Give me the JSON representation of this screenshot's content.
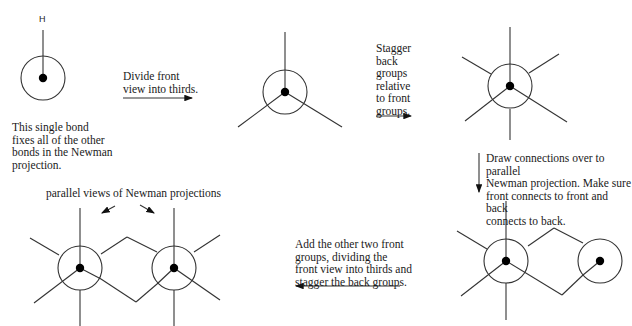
{
  "diagram": {
    "type": "newman-projection-construction-steps",
    "steps": [
      {
        "id": "step1",
        "substituent_label": "H",
        "caption": "This single bond\nfixes all of the other\nbonds in the Newman\nprojection."
      },
      {
        "id": "step2",
        "arrow_text": "Divide front\nview into thirds."
      },
      {
        "id": "step3",
        "arrow_text": "Stagger\nback\ngroups\nrelative\nto front\ngroups."
      },
      {
        "id": "step4",
        "arrow_text": "Draw connections over to parallel\nNewman projection. Make sure\nfront connects to front and back\nconnects to back."
      },
      {
        "id": "step5",
        "arrow_text": "Add the other two front\ngroups, dividing the\nfront view into thirds and\nstagger the back groups."
      },
      {
        "id": "step6",
        "caption": "parallel views of Newman projections"
      }
    ],
    "colors": {
      "line": "#333333",
      "dot": "#000000",
      "background": "#ffffff"
    }
  }
}
